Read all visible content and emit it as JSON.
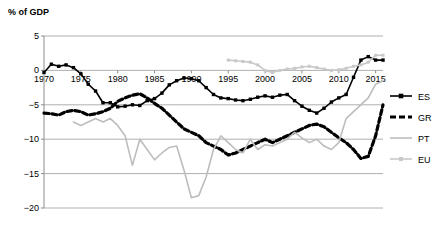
{
  "chart_data": {
    "type": "line",
    "title": "% of GDP",
    "xlabel": "",
    "ylabel": "% of GDP",
    "ylim": [
      -20,
      5
    ],
    "xlim": [
      1970,
      2016
    ],
    "yticks": [
      5,
      0,
      -5,
      -10,
      -15,
      -20
    ],
    "ytick_labels": [
      "5",
      "0",
      "-5",
      "-10",
      "-15",
      "-20"
    ],
    "xticks": [
      1970,
      1975,
      1980,
      1985,
      1990,
      1995,
      2000,
      2005,
      2010,
      2015
    ],
    "xtick_labels": [
      "1970",
      "1975",
      "1980",
      "1985",
      "1990",
      "1995",
      "2000",
      "2005",
      "2010",
      "2015"
    ],
    "grid": true,
    "legend_position": "right",
    "series": [
      {
        "name": "ES",
        "label": "ES",
        "color": "#000000",
        "style": "solid-marker",
        "x": [
          1970,
          1971,
          1972,
          1973,
          1974,
          1975,
          1976,
          1977,
          1978,
          1979,
          1980,
          1981,
          1982,
          1983,
          1984,
          1985,
          1986,
          1987,
          1988,
          1989,
          1990,
          1991,
          1992,
          1993,
          1994,
          1995,
          1996,
          1997,
          1998,
          1999,
          2000,
          2001,
          2002,
          2003,
          2004,
          2005,
          2006,
          2007,
          2008,
          2009,
          2010,
          2011,
          2012,
          2013,
          2014,
          2015,
          2016
        ],
        "y": [
          -0.3,
          0.9,
          0.6,
          0.8,
          0.4,
          -0.5,
          -2.0,
          -3.0,
          -4.7,
          -4.7,
          -5.3,
          -5.2,
          -5.0,
          -5.1,
          -4.4,
          -4.1,
          -3.3,
          -2.1,
          -1.5,
          -1.1,
          -1.2,
          -1.5,
          -2.5,
          -3.5,
          -4.0,
          -4.1,
          -4.3,
          -4.4,
          -4.2,
          -3.9,
          -3.7,
          -3.9,
          -3.6,
          -3.5,
          -4.4,
          -5.2,
          -5.8,
          -6.2,
          -5.5,
          -4.6,
          -4.0,
          -3.5,
          -1.0,
          1.5,
          2.0,
          1.5,
          1.5
        ]
      },
      {
        "name": "GR",
        "label": "GR",
        "color": "#000000",
        "style": "dashed",
        "x": [
          1970,
          1971,
          1972,
          1973,
          1974,
          1975,
          1976,
          1977,
          1978,
          1979,
          1980,
          1981,
          1982,
          1983,
          1984,
          1985,
          1986,
          1987,
          1988,
          1989,
          1990,
          1991,
          1992,
          1993,
          1994,
          1995,
          1996,
          1997,
          1998,
          1999,
          2000,
          2001,
          2002,
          2003,
          2004,
          2005,
          2006,
          2007,
          2008,
          2009,
          2010,
          2011,
          2012,
          2013,
          2014,
          2015,
          2016
        ],
        "y": [
          -6.2,
          -6.3,
          -6.5,
          -6.0,
          -5.8,
          -6.0,
          -6.5,
          -6.3,
          -6.0,
          -5.5,
          -4.5,
          -4.0,
          -3.6,
          -3.4,
          -4.0,
          -4.8,
          -5.5,
          -6.5,
          -7.5,
          -8.5,
          -9.0,
          -9.5,
          -10.5,
          -11.0,
          -11.5,
          -12.3,
          -12.0,
          -11.5,
          -11.0,
          -10.5,
          -10.0,
          -10.5,
          -10.0,
          -9.5,
          -9.0,
          -8.5,
          -8.0,
          -7.8,
          -8.2,
          -9.0,
          -9.8,
          -10.5,
          -11.5,
          -12.8,
          -12.5,
          -9.5,
          -5.0
        ]
      },
      {
        "name": "PT",
        "label": "PT",
        "color": "#bdbdbd",
        "style": "solid-thin",
        "x": [
          1974,
          1975,
          1976,
          1977,
          1978,
          1979,
          1980,
          1981,
          1982,
          1983,
          1984,
          1985,
          1986,
          1987,
          1988,
          1989,
          1990,
          1991,
          1992,
          1993,
          1994,
          1995,
          1996,
          1997,
          1998,
          1999,
          2000,
          2001,
          2002,
          2003,
          2004,
          2005,
          2006,
          2007,
          2008,
          2009,
          2010,
          2011,
          2012,
          2013,
          2014,
          2015,
          2016
        ],
        "y": [
          -7.5,
          -8.0,
          -7.5,
          -7.0,
          -7.5,
          -7.0,
          -8.0,
          -9.5,
          -13.8,
          -10.0,
          -11.5,
          -13.0,
          -12.0,
          -11.2,
          -11.0,
          -14.5,
          -18.5,
          -18.2,
          -15.5,
          -11.5,
          -9.5,
          -10.5,
          -11.5,
          -12.0,
          -10.0,
          -11.5,
          -10.8,
          -11.0,
          -10.5,
          -10.0,
          -9.0,
          -9.8,
          -10.5,
          -10.0,
          -11.0,
          -11.5,
          -10.5,
          -7.0,
          -6.0,
          -5.0,
          -4.0,
          -2.0,
          -1.5
        ]
      },
      {
        "name": "EU",
        "label": "EU",
        "color": "#c8c8c8",
        "style": "solid-marker-light",
        "x": [
          1995,
          1996,
          1997,
          1998,
          1999,
          2000,
          2001,
          2002,
          2003,
          2004,
          2005,
          2006,
          2007,
          2008,
          2009,
          2010,
          2011,
          2012,
          2013,
          2014,
          2015,
          2016
        ],
        "y": [
          1.5,
          1.4,
          1.3,
          1.2,
          0.8,
          0.0,
          -0.3,
          0.0,
          0.2,
          0.3,
          0.5,
          0.6,
          0.4,
          0.2,
          0.0,
          0.1,
          0.3,
          0.6,
          0.8,
          1.2,
          2.2,
          2.2
        ]
      }
    ]
  },
  "layout": {
    "plot_left": 44,
    "plot_right": 383,
    "plot_top": 36,
    "plot_bottom": 208
  }
}
